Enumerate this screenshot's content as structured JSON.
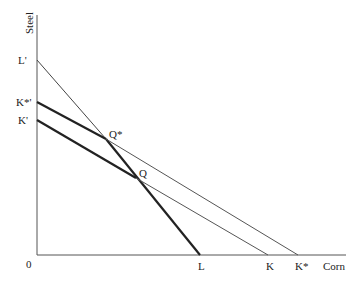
{
  "diagram": {
    "axes": {
      "y_label": "Steel",
      "x_label": "Corn",
      "origin_label": "0"
    },
    "y_intercept_labels": [
      "L'",
      "K*'",
      "K'"
    ],
    "x_intercept_labels": [
      "L",
      "K",
      "K*"
    ],
    "points": [
      "Q*",
      "Q"
    ],
    "lines": [
      {
        "name": "L'L",
        "from": "L'",
        "to": "L"
      },
      {
        "name": "K*'K*",
        "from": "K*'",
        "to": "K*"
      },
      {
        "name": "K'K",
        "from": "K'",
        "to": "K"
      }
    ]
  }
}
